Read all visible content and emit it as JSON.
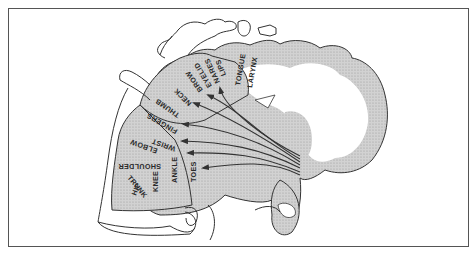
{
  "figure": {
    "type": "motor-homunculus",
    "colors": {
      "outline": "#333333",
      "cortex_shading": "#c8c8c8",
      "background": "#ffffff",
      "frame": "#555555"
    },
    "labels": [
      {
        "id": "hip",
        "text": "HIP"
      },
      {
        "id": "trunk",
        "text": "TRUNK"
      },
      {
        "id": "knee",
        "text": "KNEE"
      },
      {
        "id": "shoulder",
        "text": "SHOULDER"
      },
      {
        "id": "ankle",
        "text": "ANKLE"
      },
      {
        "id": "toes",
        "text": "TOES"
      },
      {
        "id": "elbow",
        "text": "ELBOW"
      },
      {
        "id": "wrist",
        "text": "WRIST"
      },
      {
        "id": "fingers",
        "text": "FINGERS"
      },
      {
        "id": "thumb",
        "text": "THUMB"
      },
      {
        "id": "neck",
        "text": "NECK"
      },
      {
        "id": "brow",
        "text": "BROW"
      },
      {
        "id": "eyelid",
        "text": "EYELID"
      },
      {
        "id": "nares",
        "text": "NARES"
      },
      {
        "id": "lips",
        "text": "LIPS"
      },
      {
        "id": "tongue",
        "text": "TONGUE"
      },
      {
        "id": "larynx",
        "text": "LARYNX"
      }
    ]
  }
}
